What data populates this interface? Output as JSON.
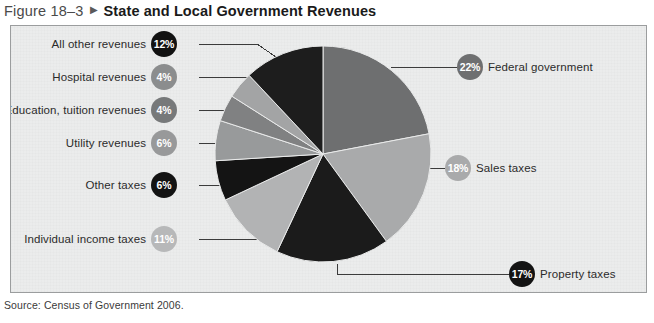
{
  "figure": {
    "number": "Figure 18–3",
    "arrow": "▶",
    "title": "State and Local Government Revenues"
  },
  "source": "Source: Census of Government 2006.",
  "chart_data": {
    "type": "pie",
    "title": "State and Local Government Revenues",
    "subtitle": "",
    "xlabel": "",
    "ylabel": "",
    "units": "percent",
    "legend_position": "callout-labels",
    "grid": false,
    "total": 100,
    "slices": [
      {
        "label": "Federal government",
        "value": 22,
        "value_label": "22%",
        "color": "#6e6f70",
        "bubble_color": "#6e6f70",
        "side": "right",
        "start_angle_deg": 0,
        "end_angle_deg": 79.2
      },
      {
        "label": "Sales taxes",
        "value": 18,
        "value_label": "18%",
        "color": "#a9aaab",
        "bubble_color": "#a9aaab",
        "side": "right",
        "start_angle_deg": 79.2,
        "end_angle_deg": 144.0
      },
      {
        "label": "Property taxes",
        "value": 17,
        "value_label": "17%",
        "color": "#1b1b1b",
        "bubble_color": "#131313",
        "side": "right",
        "start_angle_deg": 144.0,
        "end_angle_deg": 205.2
      },
      {
        "label": "Individual income taxes",
        "value": 11,
        "value_label": "11%",
        "color": "#b2b3b4",
        "bubble_color": "#b7b8b9",
        "side": "left",
        "start_angle_deg": 205.2,
        "end_angle_deg": 244.8
      },
      {
        "label": "Other taxes",
        "value": 6,
        "value_label": "6%",
        "color": "#141414",
        "bubble_color": "#131313",
        "side": "left",
        "start_angle_deg": 244.8,
        "end_angle_deg": 266.4
      },
      {
        "label": "Utility revenues",
        "value": 6,
        "value_label": "6%",
        "color": "#989a9b",
        "bubble_color": "#98999a",
        "side": "left",
        "start_angle_deg": 266.4,
        "end_angle_deg": 288.0
      },
      {
        "label": "Education, tuition revenues",
        "value": 4,
        "value_label": "4%",
        "color": "#808182",
        "bubble_color": "#77797a",
        "side": "left",
        "start_angle_deg": 288.0,
        "end_angle_deg": 302.4
      },
      {
        "label": "Hospital revenues",
        "value": 4,
        "value_label": "4%",
        "color": "#a3a4a5",
        "bubble_color": "#8b8d8e",
        "side": "left",
        "start_angle_deg": 302.4,
        "end_angle_deg": 316.8
      },
      {
        "label": "All other revenues",
        "value": 12,
        "value_label": "12%",
        "color": "#1d1d1d",
        "bubble_color": "#121212",
        "side": "left",
        "start_angle_deg": 316.8,
        "end_angle_deg": 360.0
      }
    ]
  }
}
